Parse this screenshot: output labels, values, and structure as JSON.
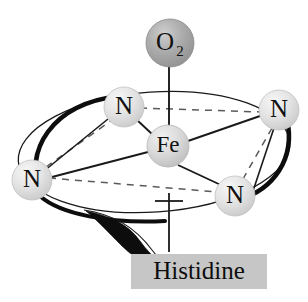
{
  "diagram": {
    "background_color": "#ffffff",
    "bond_color": "#1a1a1a",
    "dashed_color": "#5a5a5a",
    "plane_outline_color": "#1a1a1a"
  },
  "atoms": {
    "dioxygen": {
      "label": "O",
      "subscript": "2",
      "full_label": "O2",
      "fill_color": "#a9a9a9",
      "cx": 170,
      "cy": 43,
      "r": 24
    },
    "iron": {
      "label": "Fe",
      "fill_color": "#d9d9d9",
      "cx": 168,
      "cy": 146,
      "r": 21
    },
    "nitrogens": [
      {
        "id": "n-top-left",
        "label": "N",
        "fill_color": "#e2e2e2",
        "cx": 124,
        "cy": 107,
        "r": 20
      },
      {
        "id": "n-top-right",
        "label": "N",
        "fill_color": "#e2e2e2",
        "cx": 279,
        "cy": 110,
        "r": 20
      },
      {
        "id": "n-bottom-left",
        "label": "N",
        "fill_color": "#e2e2e2",
        "cx": 32,
        "cy": 180,
        "r": 20
      },
      {
        "id": "n-bottom-right",
        "label": "N",
        "fill_color": "#e2e2e2",
        "cx": 235,
        "cy": 196,
        "r": 20
      }
    ]
  },
  "ligand_box": {
    "label": "Histidine",
    "fill_color": "#c6c6c6",
    "x": 131,
    "y": 254,
    "width": 136,
    "height": 35
  },
  "bonds": {
    "axial_dioxygen": "Fe-O2 solid vertical bond",
    "equatorial": "Fe-N solid bonds to four nitrogens",
    "plane_edges": "dashed lines between adjacent nitrogens",
    "proximal": "vertical stem below Fe toward histidine"
  }
}
